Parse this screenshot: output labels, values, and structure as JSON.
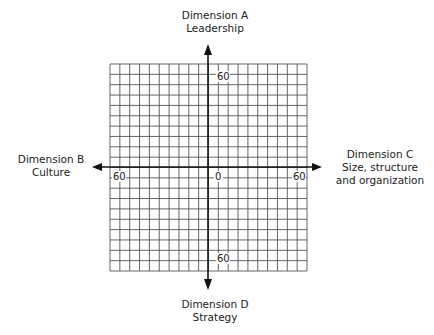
{
  "diagram": {
    "labels": {
      "top": {
        "line1": "Dimension A",
        "line2": "Leadership"
      },
      "left": {
        "line1": "Dimension B",
        "line2": "Culture"
      },
      "right": {
        "line1": "Dimension C",
        "line2": "Size, structure",
        "line3": "and organization"
      },
      "bottom": {
        "line1": "Dimension D",
        "line2": "Strategy"
      }
    },
    "ticks": {
      "top": "60",
      "left": "60",
      "origin": "0",
      "right": "60",
      "bottom": "60"
    },
    "grid": {
      "columns": 20,
      "rows": 20,
      "line_color": "#555555",
      "axis_color": "#111111"
    }
  }
}
